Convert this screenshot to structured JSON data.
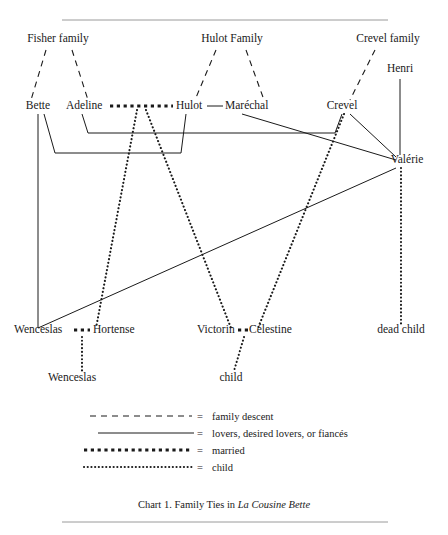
{
  "chart_data": {
    "type": "diagram",
    "title": "Chart 1. Family Ties in La Cousine Bette",
    "caption_prefix": "Chart 1. Family Ties in ",
    "caption_work": "La Cousine Bette",
    "nodes": [
      {
        "id": "fisher_family",
        "label": "Fisher family",
        "x": 58,
        "y": 42,
        "anchor": "middle"
      },
      {
        "id": "hulot_family",
        "label": "Hulot Family",
        "x": 232,
        "y": 42,
        "anchor": "middle"
      },
      {
        "id": "crevel_family",
        "label": "Crevel family",
        "x": 388,
        "y": 42,
        "anchor": "middle"
      },
      {
        "id": "henri",
        "label": "Henri",
        "x": 400,
        "y": 72,
        "anchor": "middle"
      },
      {
        "id": "bette",
        "label": "Bette",
        "x": 38,
        "y": 109,
        "anchor": "middle"
      },
      {
        "id": "adeline",
        "label": "Adeline",
        "x": 66,
        "y": 109,
        "anchor": "start"
      },
      {
        "id": "hulot",
        "label": "Hulot",
        "x": 176,
        "y": 109,
        "anchor": "start"
      },
      {
        "id": "marechal",
        "label": "Maréchal",
        "x": 225,
        "y": 109,
        "anchor": "start"
      },
      {
        "id": "crevel",
        "label": "Crevel",
        "x": 342,
        "y": 109,
        "anchor": "middle"
      },
      {
        "id": "valerie",
        "label": "Valérie",
        "x": 407,
        "y": 163,
        "anchor": "middle"
      },
      {
        "id": "wenceslas_sr",
        "label": "Wenceslas",
        "x": 14,
        "y": 333,
        "anchor": "start"
      },
      {
        "id": "hortense",
        "label": "Hortense",
        "x": 93,
        "y": 333,
        "anchor": "start"
      },
      {
        "id": "victorin",
        "label": "Victorin",
        "x": 197,
        "y": 333,
        "anchor": "start"
      },
      {
        "id": "celestine",
        "label": "Célestine",
        "x": 249,
        "y": 333,
        "anchor": "start"
      },
      {
        "id": "dead_child",
        "label": "dead child",
        "x": 401,
        "y": 333,
        "anchor": "middle"
      },
      {
        "id": "wenceslas_jr",
        "label": "Wenceslas",
        "x": 72,
        "y": 381,
        "anchor": "middle"
      },
      {
        "id": "child",
        "label": "child",
        "x": 231,
        "y": 381,
        "anchor": "middle"
      }
    ],
    "edges": [
      {
        "id": "fisher-to-bette",
        "kind": "family descent",
        "from": "fisher_family",
        "to": "bette",
        "path": "M 46,50 L 31,100"
      },
      {
        "id": "fisher-to-adeline",
        "kind": "family descent",
        "from": "fisher_family",
        "to": "adeline",
        "path": "M 72,50 L 88,100"
      },
      {
        "id": "hulot-family-to-hulot",
        "kind": "family descent",
        "from": "hulot_family",
        "to": "hulot",
        "path": "M 216,50 L 195,100"
      },
      {
        "id": "hulot-family-to-marechal",
        "kind": "family descent",
        "from": "hulot_family",
        "to": "marechal",
        "path": "M 246,50 L 264,100"
      },
      {
        "id": "crevel-family-to-crevel",
        "kind": "family descent",
        "from": "crevel_family",
        "to": "crevel",
        "path": "M 375,50 L 350,100"
      },
      {
        "id": "adeline-hulot-married",
        "kind": "married",
        "from": "adeline",
        "to": "hulot",
        "path": "M 110,106 L 173,106"
      },
      {
        "id": "hulot-marechal-brothers",
        "kind": "lovers",
        "from": "hulot",
        "to": "marechal",
        "path": "M 207,106 L 223,106"
      },
      {
        "id": "wenceslas-hortense-married",
        "kind": "married",
        "from": "wenceslas_sr",
        "to": "hortense",
        "path": "M 74,330 L 90,330"
      },
      {
        "id": "victorin-celestine-married",
        "kind": "married",
        "from": "victorin",
        "to": "celestine",
        "path": "M 238,330 L 250,330"
      },
      {
        "id": "adeline-crevel-lovers",
        "kind": "lovers",
        "from": "adeline",
        "to": "crevel",
        "path": "M 82,114 L 88,133 L 335,133 L 342,114"
      },
      {
        "id": "bette-hulot-lovers",
        "kind": "lovers",
        "from": "bette",
        "to": "hulot",
        "path": "M 44,114 L 55,153 L 181,153 L 186,114"
      },
      {
        "id": "bette-vertical",
        "kind": "lovers",
        "from": "bette",
        "to": "wenceslas_sr",
        "path": "M 38,114 L 38,328"
      },
      {
        "id": "wenceslas-valerie-lovers",
        "kind": "lovers",
        "from": "wenceslas_sr",
        "to": "valerie",
        "path": "M 38,328 L 396,168"
      },
      {
        "id": "crevel-valerie-lovers",
        "kind": "lovers",
        "from": "crevel",
        "to": "valerie",
        "path": "M 350,114 L 396,157"
      },
      {
        "id": "marechal-valerie-lovers",
        "kind": "lovers",
        "from": "marechal",
        "to": "valerie",
        "path": "M 242,114 L 396,160"
      },
      {
        "id": "henri-valerie-lovers",
        "kind": "lovers",
        "from": "henri",
        "to": "valerie",
        "path": "M 400,79 L 400,155"
      },
      {
        "id": "adeline-hulot-to-hortense",
        "kind": "child",
        "from": "adeline_hulot",
        "to": "hortense",
        "path": "M 137,110 L 96,328"
      },
      {
        "id": "adeline-hulot-to-victorin",
        "kind": "child",
        "from": "adeline_hulot",
        "to": "victorin",
        "path": "M 146,110 L 231,328"
      },
      {
        "id": "crevel-to-celestine",
        "kind": "child",
        "from": "crevel",
        "to": "celestine",
        "path": "M 344,114 L 258,328"
      },
      {
        "id": "valerie-to-dead-child",
        "kind": "child",
        "from": "valerie",
        "to": "dead_child",
        "path": "M 401,168 L 401,325"
      },
      {
        "id": "wenceslas-hortense-to-child",
        "kind": "child",
        "from": "wenceslas_hortense",
        "to": "wenceslas_jr",
        "path": "M 82,337 L 82,371"
      },
      {
        "id": "victorin-celestine-to-child",
        "kind": "child",
        "from": "victorin_celestine",
        "to": "child",
        "path": "M 244,337 L 234,371"
      }
    ],
    "legend": {
      "position": "bottom-center",
      "entries": [
        {
          "id": "family-descent",
          "kind": "family descent",
          "equals": "=",
          "label": "family descent"
        },
        {
          "id": "lovers",
          "kind": "lovers",
          "equals": "=",
          "label": "lovers, desired lovers, or fiancés"
        },
        {
          "id": "married",
          "kind": "married",
          "equals": "=",
          "label": "married"
        },
        {
          "id": "child",
          "kind": "child",
          "equals": "=",
          "label": "child"
        }
      ]
    },
    "rules": [
      {
        "id": "top-rule",
        "x1": 62,
        "y1": 20,
        "x2": 388,
        "y2": 20
      },
      {
        "id": "bottom-rule",
        "x1": 62,
        "y1": 522,
        "x2": 388,
        "y2": 522
      }
    ],
    "colors": {
      "ink": "#1a1a1a",
      "rule": "#9a9a9a",
      "background": "#ffffff"
    }
  }
}
